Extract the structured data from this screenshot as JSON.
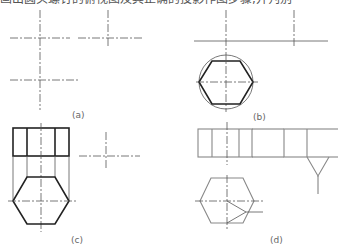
{
  "header": {
    "clipped_text": "画出圆头螺钉的俯视图及其正确的投影作图步骤,并判别"
  },
  "figures": [
    {
      "id": "a",
      "label": "(a)"
    },
    {
      "id": "b",
      "label": "(b)"
    },
    {
      "id": "c",
      "label": "(c)"
    },
    {
      "id": "d",
      "label": "(d)"
    }
  ],
  "colors": {
    "line": "#333333",
    "thin": "#666666",
    "centerline": "#555555",
    "hex_light": "#888888"
  }
}
